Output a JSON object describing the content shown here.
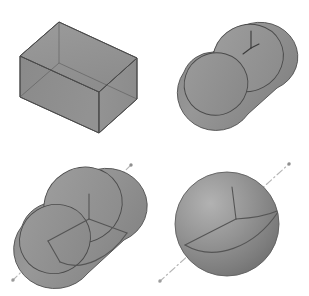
{
  "figure": {
    "title": "",
    "background_color": "#ffffff",
    "width": 309,
    "height": 296,
    "panel_count": 4
  },
  "style": {
    "face_fill": "#8f8f8f",
    "face_fill_light": "#9c9c9c",
    "face_fill_dark": "#7e7e7e",
    "face_fill_darker": "#767676",
    "edge_color": "#4a4a4a",
    "edge_width": "0.9",
    "axis_marker_color": "#3a3a3a",
    "axis_line_color": "#b5b5b5",
    "frame_line_color": "#555555",
    "sphere_highlight": "#b0b0b0",
    "sphere_shadow": "#6e6e6e"
  },
  "panels": [
    {
      "id": "panel-box",
      "name": "box",
      "position": "top-left",
      "shape_type": "rectangular-box",
      "label": "",
      "has_coordinate_frame": false,
      "has_rotation_axis": false,
      "geometry": {
        "top_back": [
          59,
          22
        ],
        "top_left": [
          20,
          56
        ],
        "top_right": [
          137,
          58
        ],
        "top_front": [
          99,
          92
        ],
        "bottom_left": [
          20,
          97
        ],
        "bottom_front": [
          99,
          133
        ],
        "bottom_right": [
          137,
          99
        ]
      }
    },
    {
      "id": "panel-cylinder",
      "name": "cylinder",
      "position": "top-right",
      "shape_type": "cylinder",
      "label": "",
      "has_coordinate_frame": true,
      "has_rotation_axis": false,
      "geometry": {
        "far_cap_center": [
          248,
          58
        ],
        "far_cap_rx": 36,
        "far_cap_ry": 33,
        "near_cap_center": [
          218,
          83
        ],
        "near_cap_rx": 32,
        "near_cap_ry": 31,
        "tilt_degrees": -28
      },
      "axis_marker": {
        "origin": [
          251,
          48
        ],
        "type": "tripod",
        "axes": 3
      }
    },
    {
      "id": "panel-cylinder-axis",
      "name": "cylinder-with-axis",
      "position": "bottom-left",
      "shape_type": "cylinder",
      "label": "",
      "has_coordinate_frame": true,
      "has_rotation_axis": true,
      "geometry": {
        "far_cap_center": [
          83,
          205
        ],
        "far_cap_rx": 40,
        "far_cap_ry": 37,
        "near_cap_center": [
          55,
          238
        ],
        "near_cap_rx": 36,
        "near_cap_ry": 34,
        "tilt_degrees": -32
      },
      "coordinate_frame": {
        "origin": [
          89,
          219
        ],
        "axis_up_end": [
          89,
          196
        ],
        "axis_left_end": [
          50,
          239
        ],
        "axis_right_end": [
          126,
          234
        ]
      },
      "rotation_axis": {
        "start": [
          12,
          281
        ],
        "end": [
          132,
          164
        ],
        "line_style": "dash-dot",
        "end_marker": "dot"
      }
    },
    {
      "id": "panel-sphere",
      "name": "sphere",
      "position": "bottom-right",
      "shape_type": "sphere",
      "label": "",
      "has_coordinate_frame": true,
      "has_rotation_axis": true,
      "geometry": {
        "center": [
          227,
          224
        ],
        "radius": 52,
        "shading": "radial-gradient",
        "highlight_offset": [
          -0.3,
          -0.32
        ]
      },
      "coordinate_frame": {
        "origin": [
          236,
          219
        ],
        "axis_up_end": [
          231,
          188
        ],
        "axis_left_end": [
          186,
          244
        ],
        "axis_right_end": [
          274,
          214
        ]
      },
      "rotation_axis": {
        "start": [
          159,
          282
        ],
        "end": [
          290,
          163
        ],
        "line_style": "dash-dot",
        "end_marker": "dot"
      }
    }
  ]
}
